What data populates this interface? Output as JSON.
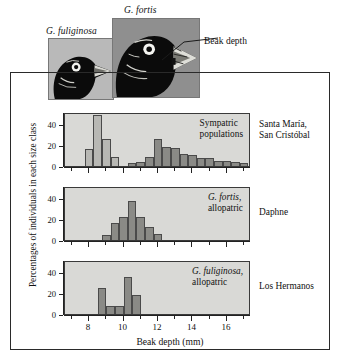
{
  "figure": {
    "beak_depth_callout": "Beak depth",
    "species_photo_labels": [
      {
        "name": "G. fuliginosa",
        "photo_alt": "finch-head-fuliginosa"
      },
      {
        "name": "G. fortis",
        "photo_alt": "finch-head-fortis"
      }
    ]
  },
  "chart_data": {
    "type": "bar",
    "title": "",
    "xlabel": "Beak depth (mm)",
    "ylabel": "Percentages of individuals in each size class",
    "xlim": [
      6.6,
      17.4
    ],
    "ylim": [
      0,
      52
    ],
    "xticks": [
      8,
      10,
      12,
      14,
      16
    ],
    "xtick_labels": [
      "8",
      "10",
      "12",
      "14",
      "16"
    ],
    "yticks": [
      0,
      20,
      40
    ],
    "ytick_labels": [
      "0",
      "20",
      "40"
    ],
    "grid": false,
    "legend_position": "none",
    "bin_width": 0.5,
    "panels": [
      {
        "id": "sympatric",
        "note": "Sympatric populations",
        "note_italic": "",
        "island": "Santa María,\nSan Cristóbal",
        "island_lines": [
          "Santa María,",
          "San Cristóbal"
        ],
        "series": [
          {
            "name": "G. fuliginosa",
            "color": "#b8b8b4",
            "x": [
              7.75,
              8.25,
              8.75,
              9.25,
              9.75
            ],
            "values": [
              16,
              49,
              26,
              9,
              0
            ]
          },
          {
            "name": "G. fortis",
            "color": "#8a8a86",
            "x": [
              10.25,
              10.75,
              11.25,
              11.75,
              12.25,
              12.75,
              13.25,
              13.75,
              14.25,
              14.75,
              15.25,
              15.75,
              16.25,
              16.75
            ],
            "values": [
              3,
              4,
              9,
              26,
              18,
              17,
              12,
              11,
              8,
              8,
              5,
              5,
              4,
              3
            ]
          }
        ]
      },
      {
        "id": "fortis-allopatric",
        "note": "G. fortis,\nallopatric",
        "note_lines_italic": [
          "G. fortis,"
        ],
        "note_lines_plain": [
          "allopatric"
        ],
        "island": "Daphne",
        "island_lines": [
          "Daphne"
        ],
        "series": [
          {
            "name": "G. fortis allopatric",
            "color": "#8a8a86",
            "x": [
              8.75,
              9.25,
              9.75,
              10.25,
              10.75,
              11.25,
              11.75
            ],
            "values": [
              5,
              16,
              22,
              38,
              22,
              13,
              6
            ]
          }
        ]
      },
      {
        "id": "fuliginosa-allopatric",
        "note": "G. fuliginosa,\nallopatric",
        "note_lines_italic": [
          "G. fuliginosa,"
        ],
        "note_lines_plain": [
          "allopatric"
        ],
        "island": "Los Hermanos",
        "island_lines": [
          "Los Hermanos"
        ],
        "series": [
          {
            "name": "G. fuliginosa allopatric",
            "color": "#8a8a86",
            "x": [
              8.5,
              9.0,
              9.5,
              10.0,
              10.5
            ],
            "values": [
              25,
              8,
              8,
              36,
              18
            ]
          }
        ]
      }
    ]
  },
  "colors": {
    "panel_background": "#d9d9d6",
    "bar_light": "#b8b8b4",
    "bar_dark": "#8a8a86",
    "axis": "#222222",
    "frame": "#2a2a2a",
    "text": "#111111",
    "photo_bg_fuliginosa": "#b9b9b9",
    "photo_bg_fortis": "#8f8f8f"
  }
}
